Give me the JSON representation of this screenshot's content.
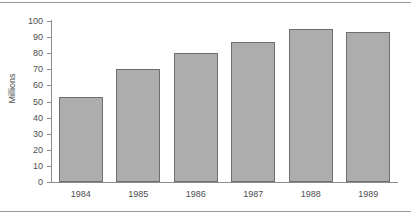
{
  "chart_data": {
    "type": "bar",
    "title": "",
    "subtitle": "",
    "xlabel": "",
    "ylabel": "Millions",
    "categories": [
      "1984",
      "1985",
      "1986",
      "1987",
      "1988",
      "1989"
    ],
    "values": [
      53,
      70,
      80,
      87,
      95,
      93
    ],
    "series": [
      {
        "name": "Millions",
        "values": [
          53,
          70,
          80,
          87,
          95,
          93
        ]
      }
    ],
    "ylim": [
      0,
      100
    ],
    "ytick_labels": [
      "100",
      "90",
      "80",
      "70",
      "60",
      "50",
      "40",
      "30",
      "20",
      "10",
      "0"
    ],
    "ytick_values": [
      100,
      90,
      80,
      70,
      60,
      50,
      40,
      30,
      20,
      10,
      0
    ],
    "grid": false,
    "legend": false,
    "legend_position": "none",
    "annotations": [],
    "colors": {
      "bar_fill": "#adadad",
      "bar_border": "#6e6e6e",
      "axis": "#8d8d8d",
      "text": "#4e4e4e",
      "background": "#ffffff",
      "rule": "#9a9a9a"
    }
  }
}
